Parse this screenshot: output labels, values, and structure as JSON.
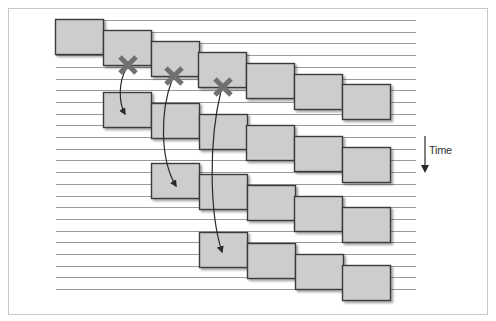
{
  "diagram": {
    "type": "pipelined-timeline",
    "axis_label": "Time",
    "axis_direction": "down",
    "colors": {
      "box_fill": "#cdcdcd",
      "box_stroke": "#3a3a3a",
      "line": "#9a9a9a",
      "cross": "#707070",
      "arrow": "#2a2a2a",
      "frame": "#c8c8c8"
    },
    "lines": {
      "count": 24,
      "y_start": 20,
      "y_step": 11.7,
      "x_start": 56,
      "x_end": 416
    },
    "box": {
      "width": 48,
      "height": 35,
      "x_step": 47.8,
      "y_step": 10.9
    },
    "rows": [
      {
        "label": "row-1",
        "x0": 55,
        "y0": 19,
        "count": 7
      },
      {
        "label": "row-2",
        "x0": 103,
        "y0": 92,
        "count": 6
      },
      {
        "label": "row-3",
        "x0": 151,
        "y0": 163,
        "count": 5
      },
      {
        "label": "row-4",
        "x0": 199,
        "y0": 232,
        "count": 4
      }
    ],
    "cancellations": [
      {
        "cross": [
          128,
          65
        ],
        "arrow_to": [
          125,
          114
        ]
      },
      {
        "cross": [
          174,
          76
        ],
        "arrow_to": [
          176,
          186
        ]
      },
      {
        "cross": [
          223,
          87
        ],
        "arrow_to": [
          222,
          252
        ]
      }
    ]
  }
}
